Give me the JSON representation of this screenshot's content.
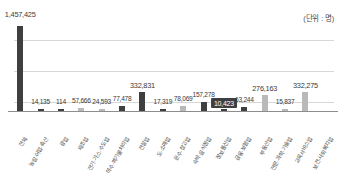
{
  "unit_note": "(단위 : 명)",
  "chart_data": {
    "type": "bar",
    "title": "",
    "subtitle": "",
    "xlabel": "",
    "ylabel": "",
    "unit": "(단위 : 명)",
    "grid": true,
    "gridlines": 3,
    "legend": "none",
    "ylim": [
      0,
      1457425
    ],
    "highlight_index": 10,
    "categories": [
      "전체",
      "농림·어업·축산",
      "광업",
      "제조업",
      "전기·가스·수도업",
      "하수·폐기물처리업",
      "건설업",
      "도·소매업",
      "운수·창고업",
      "숙박·음식점업",
      "정보통신업",
      "금융·보험업",
      "부동산업",
      "전문·과학·기술업",
      "교육서비스업",
      "보건·사회복지업"
    ],
    "values": [
      1457425,
      14135,
      114,
      57666,
      24593,
      77478,
      332831,
      17319,
      78069,
      157278,
      10423,
      63244,
      276163,
      15837,
      332275,
      0
    ],
    "value_labels": [
      "1,457,425",
      "14,135",
      "114",
      "57,666",
      "24,593",
      "77,478",
      "332,831",
      "17,319",
      "78,069",
      "157,278",
      "10,423",
      "63,244",
      "276,163",
      "15,837",
      "332,275",
      ""
    ]
  }
}
